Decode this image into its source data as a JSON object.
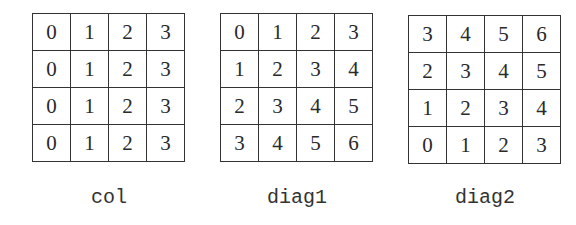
{
  "panels": [
    {
      "label": "col",
      "grid": [
        [
          "0",
          "1",
          "2",
          "3"
        ],
        [
          "0",
          "1",
          "2",
          "3"
        ],
        [
          "0",
          "1",
          "2",
          "3"
        ],
        [
          "0",
          "1",
          "2",
          "3"
        ]
      ]
    },
    {
      "label": "diag1",
      "grid": [
        [
          "0",
          "1",
          "2",
          "3"
        ],
        [
          "1",
          "2",
          "3",
          "4"
        ],
        [
          "2",
          "3",
          "4",
          "5"
        ],
        [
          "3",
          "4",
          "5",
          "6"
        ]
      ]
    },
    {
      "label": "diag2",
      "grid": [
        [
          "3",
          "4",
          "5",
          "6"
        ],
        [
          "2",
          "3",
          "4",
          "5"
        ],
        [
          "1",
          "2",
          "3",
          "4"
        ],
        [
          "0",
          "1",
          "2",
          "3"
        ]
      ]
    }
  ]
}
